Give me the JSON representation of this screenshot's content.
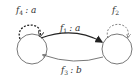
{
  "diagram": {
    "type": "state-transition",
    "nodes": [
      {
        "id": "left",
        "label": ""
      },
      {
        "id": "right",
        "label": ""
      }
    ],
    "edges": [
      {
        "id": "f1",
        "from": "left",
        "to": "right",
        "label_fn": "f",
        "label_sub": "1",
        "label_sym": ": a",
        "style": "solid-thick"
      },
      {
        "id": "f2",
        "from": "right",
        "to": "right",
        "label_fn": "f",
        "label_sub": "2",
        "label_sym": "",
        "style": "dashed-thin"
      },
      {
        "id": "f3",
        "from": "right",
        "to": "left",
        "label_fn": "f",
        "label_sub": "3",
        "label_sym": ": b",
        "style": "solid-thin"
      },
      {
        "id": "f4",
        "from": "left",
        "to": "left",
        "label_fn": "f",
        "label_sub": "4",
        "label_sym": ": a",
        "style": "dashed-thick"
      }
    ],
    "colors": {
      "stroke": "#333333",
      "thin_stroke": "#555555",
      "background": "#ffffff"
    }
  }
}
